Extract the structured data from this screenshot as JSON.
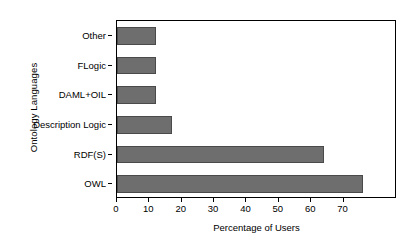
{
  "chart_data": {
    "type": "bar",
    "orientation": "horizontal",
    "title": "",
    "xlabel": "Percentage of Users",
    "ylabel": "Ontology Languages",
    "categories": [
      "OWL",
      "RDF(S)",
      "Description Logic",
      "DAML+OIL",
      "FLogic",
      "Other"
    ],
    "values": [
      76,
      64,
      17,
      12,
      12,
      12
    ],
    "xlim": [
      0,
      86.5
    ],
    "xticks": [
      0,
      10,
      20,
      30,
      40,
      50,
      60,
      70
    ],
    "xticklabels": [
      "0",
      "10",
      "20",
      "30",
      "40",
      "50",
      "60",
      "70"
    ],
    "grid": false,
    "legend": null,
    "bar_color": "#6e6e6e",
    "bar_edge_color": "#4a4a4a",
    "axis_color": "#000000",
    "background_color": "#ffffff"
  }
}
